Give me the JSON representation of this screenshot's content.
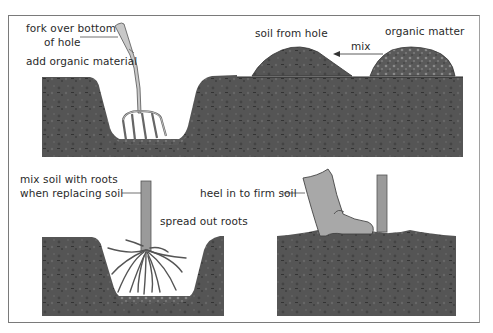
{
  "figure": {
    "colors": {
      "soil": "#4f4f4f",
      "soil_dark": "#3a3a3a",
      "soil_light": "#6a6a6a",
      "tool_gray": "#b8b8b8",
      "boot_gray": "#a8a8a8",
      "stem_gray": "#9a9a9a",
      "border": "#7a7a7a",
      "text": "#2a2a2a"
    }
  },
  "panels": {
    "prepare": {
      "labels": {
        "fork_line1": "fork over bottom",
        "fork_line2": "of hole",
        "add_organic": "add organic material",
        "soil_from_hole": "soil from hole",
        "organic_matter": "organic matter",
        "mix": "mix"
      },
      "icons": [
        "garden-fork",
        "soil-mound",
        "organic-matter-mound",
        "arrow-left"
      ]
    },
    "plant": {
      "labels": {
        "mix_line1": "mix soil with roots",
        "mix_line2": "when replacing soil",
        "spread_roots": "spread out roots"
      },
      "icons": [
        "tree-stem",
        "roots"
      ]
    },
    "firm": {
      "labels": {
        "heel_in": "heel in to firm soil"
      },
      "icons": [
        "boot",
        "tree-stem"
      ]
    }
  }
}
